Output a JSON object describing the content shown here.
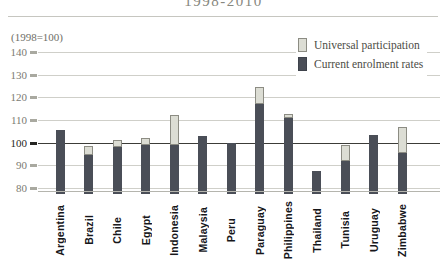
{
  "page": {
    "title": "1998-2010",
    "index_note": "(1998=100)"
  },
  "legend": {
    "items": [
      {
        "label": "Universal participation",
        "color": "#dcddd4",
        "border": "#8c8c83"
      },
      {
        "label": "Current enrolment rates",
        "color": "#4a4e57",
        "border": "#3e424b"
      }
    ]
  },
  "chart_data": {
    "type": "bar",
    "stacked": true,
    "title": "1998-2010",
    "subtitle_note": "(1998=100)",
    "categories": [
      "Argentina",
      "Brazil",
      "Chile",
      "Egypt",
      "Indonesia",
      "Malaysia",
      "Peru",
      "Paraguay",
      "Philippines",
      "Thailand",
      "Tunisia",
      "Uruguay",
      "Zimbabwe"
    ],
    "series": [
      {
        "name": "Current enrolment rates",
        "color": "#4a4e57",
        "values": [
          105.5,
          94.5,
          98,
          99,
          99,
          103,
          100,
          117,
          111,
          87.5,
          92,
          103.5,
          95.5
        ]
      },
      {
        "name": "Universal participation",
        "color": "#dcddd4",
        "values": [
          0,
          4,
          3,
          3,
          13,
          0,
          0,
          7.5,
          1.5,
          0,
          7,
          0,
          11.5
        ]
      }
    ],
    "stack_totals": [
      105.5,
      98.5,
      101,
      102,
      112,
      103,
      100,
      124.5,
      112.5,
      87.5,
      99,
      103.5,
      107
    ],
    "yticks": [
      140,
      130,
      120,
      110,
      100,
      90,
      80
    ],
    "ylim": [
      80,
      140
    ],
    "baseline_emphasis": 100,
    "grid": true,
    "legend_position": "top-right",
    "x_tick_label_rotation": 90
  }
}
